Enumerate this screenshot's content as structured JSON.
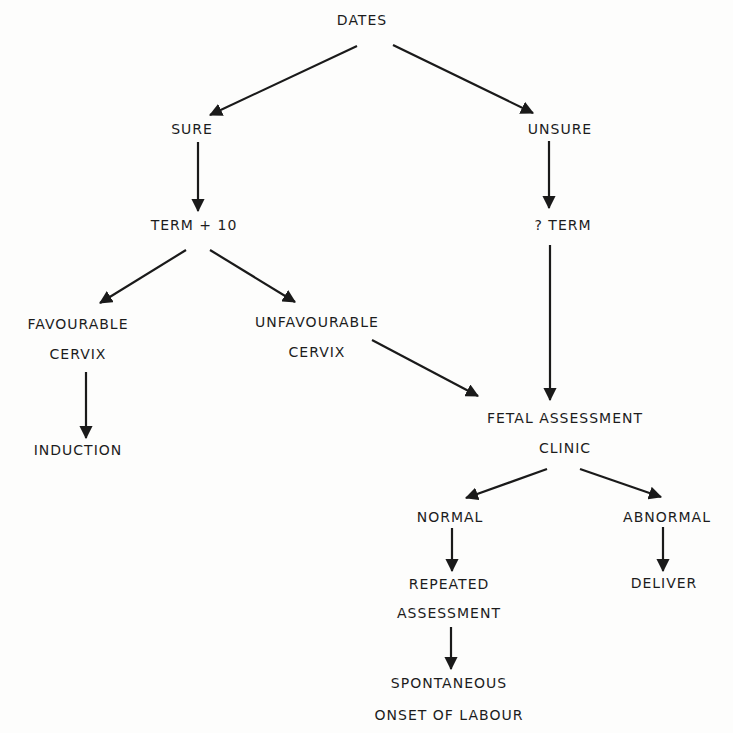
{
  "diagram": {
    "type": "flowchart",
    "nodes": [
      {
        "id": "dates",
        "label": "DATES",
        "x": 362,
        "y": 20
      },
      {
        "id": "sure",
        "label": "SURE",
        "x": 192,
        "y": 129
      },
      {
        "id": "unsure",
        "label": "UNSURE",
        "x": 560,
        "y": 129
      },
      {
        "id": "term10",
        "label": "TERM + 10",
        "x": 194,
        "y": 225
      },
      {
        "id": "qterm",
        "label": "? TERM",
        "x": 563,
        "y": 225
      },
      {
        "id": "favourable",
        "label": "FAVOURABLE",
        "x": 78,
        "y": 324
      },
      {
        "id": "favourable_cervix",
        "label": "CERVIX",
        "x": 78,
        "y": 354
      },
      {
        "id": "unfavourable",
        "label": "UNFAVOURABLE",
        "x": 317,
        "y": 322
      },
      {
        "id": "unfavourable_cervix",
        "label": "CERVIX",
        "x": 317,
        "y": 352
      },
      {
        "id": "induction",
        "label": "INDUCTION",
        "x": 78,
        "y": 450
      },
      {
        "id": "fetal",
        "label": "FETAL ASSESSMENT",
        "x": 565,
        "y": 418
      },
      {
        "id": "fetal_clinic",
        "label": "CLINIC",
        "x": 565,
        "y": 448
      },
      {
        "id": "normal",
        "label": "NORMAL",
        "x": 450,
        "y": 517
      },
      {
        "id": "abnormal",
        "label": "ABNORMAL",
        "x": 667,
        "y": 517
      },
      {
        "id": "repeated",
        "label": "REPEATED",
        "x": 449,
        "y": 584
      },
      {
        "id": "repeated_assessment",
        "label": "ASSESSMENT",
        "x": 449,
        "y": 613
      },
      {
        "id": "deliver",
        "label": "DELIVER",
        "x": 664,
        "y": 583
      },
      {
        "id": "spontaneous",
        "label": "SPONTANEOUS",
        "x": 449,
        "y": 683
      },
      {
        "id": "onset",
        "label": "ONSET OF LABOUR",
        "x": 449,
        "y": 715
      }
    ],
    "edges": [
      {
        "from": "DATES",
        "to": "SURE",
        "x1": 357,
        "y1": 46,
        "x2": 210,
        "y2": 115
      },
      {
        "from": "DATES",
        "to": "UNSURE",
        "x1": 393,
        "y1": 45,
        "x2": 533,
        "y2": 113
      },
      {
        "from": "SURE",
        "to": "TERM + 10",
        "x1": 198,
        "y1": 142,
        "x2": 198,
        "y2": 211
      },
      {
        "from": "UNSURE",
        "to": "? TERM",
        "x1": 549,
        "y1": 141,
        "x2": 549,
        "y2": 208
      },
      {
        "from": "TERM + 10",
        "to": "FAVOURABLE CERVIX",
        "x1": 186,
        "y1": 250,
        "x2": 100,
        "y2": 303
      },
      {
        "from": "TERM + 10",
        "to": "UNFAVOURABLE CERVIX",
        "x1": 210,
        "y1": 250,
        "x2": 295,
        "y2": 302
      },
      {
        "from": "FAVOURABLE CERVIX",
        "to": "INDUCTION",
        "x1": 86,
        "y1": 372,
        "x2": 86,
        "y2": 438
      },
      {
        "from": "UNFAVOURABLE CERVIX",
        "to": "FETAL ASSESSMENT CLINIC",
        "x1": 372,
        "y1": 340,
        "x2": 478,
        "y2": 396
      },
      {
        "from": "? TERM",
        "to": "FETAL ASSESSMENT CLINIC",
        "x1": 550,
        "y1": 245,
        "x2": 550,
        "y2": 400
      },
      {
        "from": "FETAL ASSESSMENT CLINIC",
        "to": "NORMAL",
        "x1": 547,
        "y1": 469,
        "x2": 466,
        "y2": 498
      },
      {
        "from": "FETAL ASSESSMENT CLINIC",
        "to": "ABNORMAL",
        "x1": 580,
        "y1": 469,
        "x2": 661,
        "y2": 497
      },
      {
        "from": "NORMAL",
        "to": "REPEATED ASSESSMENT",
        "x1": 452,
        "y1": 528,
        "x2": 452,
        "y2": 571
      },
      {
        "from": "ABNORMAL",
        "to": "DELIVER",
        "x1": 663,
        "y1": 527,
        "x2": 663,
        "y2": 571
      },
      {
        "from": "REPEATED ASSESSMENT",
        "to": "SPONTANEOUS ONSET OF LABOUR",
        "x1": 451,
        "y1": 627,
        "x2": 451,
        "y2": 669
      }
    ],
    "colors": {
      "ink": "#1a1a1a",
      "background": "#fdfdfc"
    }
  }
}
